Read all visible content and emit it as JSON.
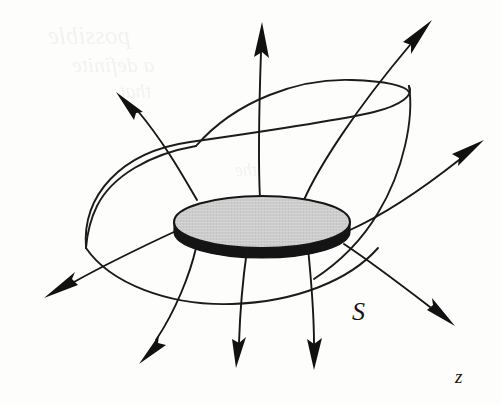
{
  "figure": {
    "background_color": "#fdfdfc",
    "width": 501,
    "height": 404
  },
  "labels": {
    "surface": "S",
    "axis": "z"
  },
  "disk": {
    "name": "charged-disk",
    "top_face_color": "#cdcdcd",
    "rim_color": "#141414",
    "outline_color": "#161616",
    "center_x": 262,
    "center_y": 222,
    "radius_x": 88,
    "radius_y": 26,
    "rim_thickness": 17
  },
  "surface": {
    "name": "closed-surface-S",
    "stroke_color": "#1c1c1c",
    "stroke_width": 1.9,
    "description": "rounded pillbox-like closed surface enclosing the disk"
  },
  "field_lines": {
    "stroke_color": "#171717",
    "stroke_width": 1.9,
    "count": 9,
    "arrow_color": "#111111",
    "directions": [
      "up-left",
      "up",
      "up-right",
      "right",
      "left",
      "down-left",
      "down",
      "down",
      "down-right"
    ]
  },
  "bleed_through": {
    "line_1": "possible",
    "line_2": "a definite",
    "line_3": "that",
    "line_4": "the"
  }
}
